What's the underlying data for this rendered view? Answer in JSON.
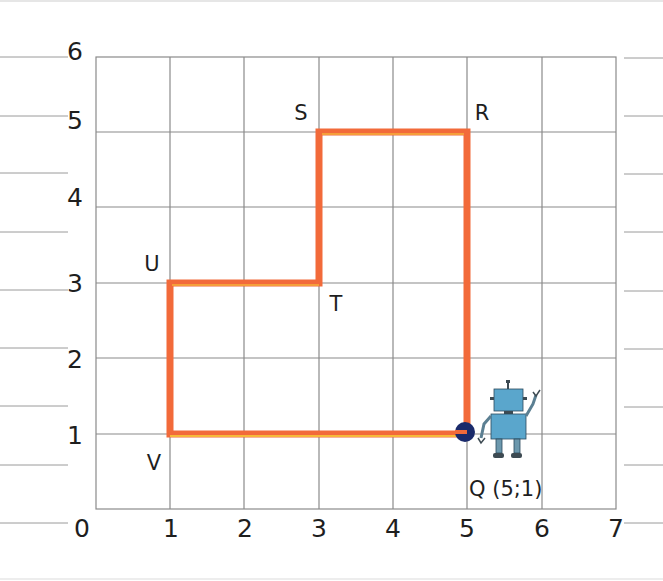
{
  "diagram": {
    "type": "coordinate-grid-path",
    "x_axis": {
      "min": 0,
      "max": 7,
      "ticks": [
        "0",
        "1",
        "2",
        "3",
        "4",
        "5",
        "6",
        "7"
      ]
    },
    "y_axis": {
      "min": 0,
      "max": 6,
      "ticks": [
        "0",
        "1",
        "2",
        "3",
        "4",
        "5",
        "6"
      ]
    },
    "colors": {
      "path": "#f26a3a",
      "path_inner": "#f7d43a",
      "grid": "#8a8a8a",
      "point": "#1a2a6b",
      "robot": "#5aa6cc"
    },
    "path_points": [
      {
        "name": "Q",
        "x": 5,
        "y": 1
      },
      {
        "name": "R",
        "x": 5,
        "y": 5
      },
      {
        "name": "S",
        "x": 3,
        "y": 5
      },
      {
        "name": "T",
        "x": 3,
        "y": 3
      },
      {
        "name": "U",
        "x": 1,
        "y": 3
      },
      {
        "name": "V",
        "x": 1,
        "y": 1
      }
    ],
    "labels": {
      "R": "R",
      "S": "S",
      "T": "T",
      "U": "U",
      "V": "V",
      "Q": "Q (5;1)"
    }
  }
}
